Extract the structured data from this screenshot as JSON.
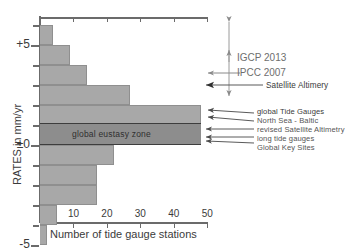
{
  "chart_data": {
    "type": "bar",
    "orientation": "horizontal",
    "title": "",
    "xlabel": "Number of tide gauge stations",
    "ylabel": "RATES in mm/yr",
    "xlim": [
      0,
      52
    ],
    "ylim": [
      -5,
      6.5
    ],
    "xticks": [
      10,
      20,
      30,
      40,
      50
    ],
    "yticks": [
      5,
      0,
      -5
    ],
    "ytick_labels": [
      "+5",
      "±0",
      "-5"
    ],
    "ytick_minor": [
      6,
      4,
      3,
      2,
      1,
      -1,
      -2,
      -3,
      -4
    ],
    "grid": false,
    "legend": "none",
    "bin_width_mm_per_yr": 1,
    "categories": [
      "+6 to +5",
      "+5 to +4",
      "+4 to +3",
      "+3 to +2",
      "+2 to +1",
      "+1 to 0",
      "0 to -1",
      "-1 to -2",
      "-2 to -3",
      "-3 to -4",
      "-4 to -5"
    ],
    "bin_centers": [
      5.5,
      4.5,
      3.5,
      2.5,
      1.5,
      0.5,
      -0.5,
      -1.5,
      -2.5,
      -3.5,
      -4.5
    ],
    "values": [
      4,
      9,
      14,
      27,
      48,
      48,
      22,
      17,
      17,
      5,
      2
    ],
    "bands": [
      {
        "name": "global eustasy zone",
        "y_from": 0.0,
        "y_to": 1.1,
        "label": "global eustasy zone"
      }
    ],
    "annotations": [
      {
        "label": "IGCP 2013",
        "y": 3.3
      },
      {
        "label": "IPCC 2007",
        "y": 1.8
      },
      {
        "label": "Satellite Altimery",
        "y": 1.3
      },
      {
        "label": "global Tide Gauges",
        "y": 1.05
      },
      {
        "label": "North Sea - Baltic",
        "y": 0.8
      },
      {
        "label": "revised Satellite Altimetry",
        "y": 0.45
      },
      {
        "label": "long tide gauges",
        "y": 0.2
      },
      {
        "label": "Global Key Sites",
        "y": 0.0
      }
    ]
  },
  "axes": {
    "y_title": "RATES in mm/yr",
    "x_title": "Number of tide gauge stations",
    "y_labels": {
      "top": "+5",
      "zero": "±0",
      "bottom": "-5"
    },
    "x_labels": [
      "10",
      "20",
      "30",
      "40",
      "50"
    ]
  },
  "band": {
    "eustasy_label": "global eustasy zone"
  },
  "callouts": {
    "igcp": "IGCP 2013",
    "ipcc": "IPCC 2007",
    "satellite_altimetry": "Satellite Altimery",
    "global_tide_gauges": "global Tide Gauges",
    "north_sea_baltic": "North Sea - Baltic",
    "revised_satellite_altimetry": "revised Satellite Altimetry",
    "long_tide_gauges": "long tide gauges",
    "global_key_sites": "Global Key Sites"
  },
  "colors": {
    "bar_fill": "#a8a8a8",
    "band_fill": "#8d8d8d",
    "axis": "#6b6b6b",
    "text": "#3b3b3b",
    "annotation_text": "#555555"
  }
}
